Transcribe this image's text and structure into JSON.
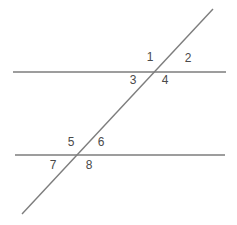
{
  "figure": {
    "background_color": "#ffffff",
    "line_color": "#7d7d7d",
    "label_color": "#4a4a4a",
    "line_width": 1.4,
    "width": 237,
    "height": 225
  },
  "lines": {
    "top_parallel": {
      "name": "top horizontal line",
      "x1": 13,
      "y1": 72,
      "x2": 226,
      "y2": 72
    },
    "bottom_parallel": {
      "name": "bottom horizontal line",
      "x1": 15,
      "y1": 155,
      "x2": 225,
      "y2": 155
    },
    "transversal": {
      "name": "diagonal transversal line",
      "x1": 22,
      "y1": 214,
      "x2": 213,
      "y2": 9
    }
  },
  "intersections": {
    "upper": {
      "name": "upper intersection point",
      "x": 157,
      "y": 72
    },
    "lower": {
      "name": "lower intersection point",
      "x": 78,
      "y": 155
    }
  },
  "labels": [
    {
      "id": "angle-1",
      "text": "1",
      "x": 150,
      "y": 57
    },
    {
      "id": "angle-2",
      "text": "2",
      "x": 188,
      "y": 58
    },
    {
      "id": "angle-3",
      "text": "3",
      "x": 133,
      "y": 80
    },
    {
      "id": "angle-4",
      "text": "4",
      "x": 165,
      "y": 80
    },
    {
      "id": "angle-5",
      "text": "5",
      "x": 71,
      "y": 142
    },
    {
      "id": "angle-6",
      "text": "6",
      "x": 101,
      "y": 142
    },
    {
      "id": "angle-7",
      "text": "7",
      "x": 53,
      "y": 165
    },
    {
      "id": "angle-8",
      "text": "8",
      "x": 89,
      "y": 165
    }
  ]
}
